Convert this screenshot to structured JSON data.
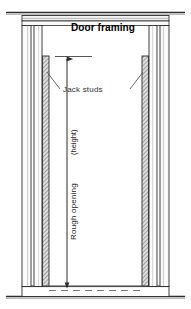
{
  "drawing": {
    "title": "Door framing",
    "type": "architectural-detail",
    "view": "elevation",
    "subject": "wood stud door rough opening framing"
  },
  "labels": {
    "title": "Door framing",
    "jack_studs": "Jack studs",
    "rough_opening": "Rough opening",
    "height": "(height)"
  },
  "colors": {
    "line": "#2b2b2b",
    "hatch": "#4a4a4a",
    "fill_light": "#f2f2f2",
    "fill_stud": "#d8d8d8",
    "text": "#000000",
    "background": "#ffffff"
  },
  "components": [
    {
      "name": "top-plate",
      "label": "Top plate"
    },
    {
      "name": "header",
      "label": "Header"
    },
    {
      "name": "king-stud-left",
      "label": "King stud"
    },
    {
      "name": "king-stud-right",
      "label": "King stud"
    },
    {
      "name": "jack-stud-left",
      "label": "Jack stud"
    },
    {
      "name": "jack-stud-right",
      "label": "Jack stud"
    },
    {
      "name": "bottom-plate",
      "label": "Bottom plate"
    },
    {
      "name": "floor-line",
      "label": "Floor"
    },
    {
      "name": "rough-opening-dimension",
      "label": "Rough opening (height)"
    }
  ]
}
